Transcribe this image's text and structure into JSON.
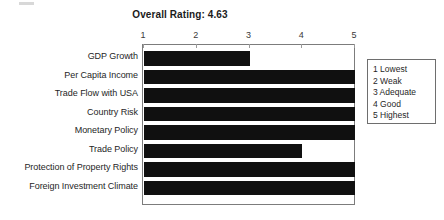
{
  "chart_data": {
    "type": "bar",
    "orientation": "horizontal",
    "title": "Overall Rating: 4.63",
    "xlabel": "",
    "ylabel": "",
    "xlim": [
      1,
      5
    ],
    "grid": false,
    "axis_position": "top",
    "tick_labels": [
      "1",
      "2",
      "3",
      "4",
      "5"
    ],
    "tick_values": [
      1,
      2,
      3,
      4,
      5
    ],
    "categories": [
      "GDP Growth",
      "Per Capita Income",
      "Trade Flow with USA",
      "Country Risk",
      "Monetary Policy",
      "Trade Policy",
      "Protection of Property Rights",
      "Foreign Investment Climate"
    ],
    "values": [
      3,
      5,
      5,
      5,
      5,
      4,
      5,
      5
    ],
    "bar_color": "#101010",
    "legend_position": "right-outside",
    "legend_entries": [
      "1 Lowest",
      "2 Weak",
      "3 Adequate",
      "4 Good",
      "5 Highest"
    ]
  }
}
